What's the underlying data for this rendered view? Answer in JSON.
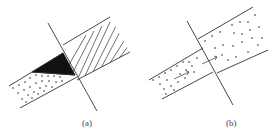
{
  "figure": {
    "panels": [
      {
        "label": "(a)",
        "description": "Two offset bands meeting at an oblique boundary line; right band hatched, left band dotted, black triangular overlap wedge"
      },
      {
        "label": "(b)",
        "description": "Two offset bands meeting at an oblique boundary line; both bands filled with dots, arrows indicating flow across boundary"
      }
    ]
  },
  "colors": {
    "line": "#333333",
    "fill_dark": "#111111",
    "background": "#ffffff"
  }
}
